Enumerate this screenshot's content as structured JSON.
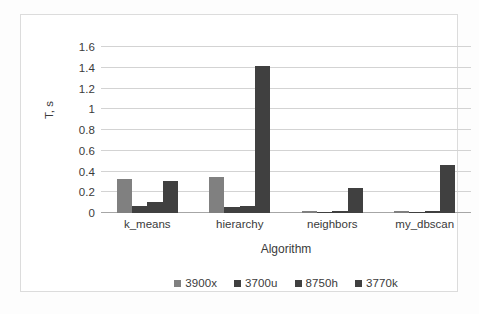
{
  "chart_data": {
    "type": "bar",
    "title": "",
    "xlabel": "Algorithm",
    "ylabel": "T, s",
    "ylim": [
      0,
      1.6
    ],
    "ytick_labels": [
      "0",
      "0.2",
      "0.4",
      "0.6",
      "0.8",
      "1",
      "1.2",
      "1.4",
      "1.6"
    ],
    "ytick_values": [
      0,
      0.2,
      0.4,
      0.6,
      0.8,
      1,
      1.2,
      1.4,
      1.6
    ],
    "grid": "horizontal",
    "legend_position": "bottom",
    "categories": [
      "k_means",
      "hierarchy",
      "neighbors",
      "my_dbscan"
    ],
    "series": [
      {
        "name": "3900x",
        "color": "#808080",
        "values": [
          0.33,
          0.35,
          0.02,
          0.02
        ]
      },
      {
        "name": "3700u",
        "color": "#404040",
        "values": [
          0.07,
          0.06,
          0.005,
          0.005
        ]
      },
      {
        "name": "8750h",
        "color": "#404040",
        "values": [
          0.11,
          0.07,
          0.02,
          0.02
        ]
      },
      {
        "name": "3770k",
        "color": "#404040",
        "values": [
          0.31,
          1.42,
          0.24,
          0.46
        ]
      }
    ]
  },
  "legend": {
    "items": [
      {
        "label": "3900x"
      },
      {
        "label": "3700u"
      },
      {
        "label": "8750h"
      },
      {
        "label": "3770k"
      }
    ]
  },
  "axes": {
    "x_title": "Algorithm",
    "y_title": "T, s"
  }
}
